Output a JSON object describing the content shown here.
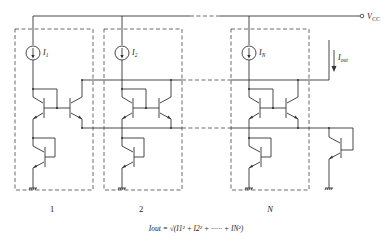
{
  "diagram": {
    "type": "circuit-schematic",
    "supply_label": "V",
    "supply_subscript": "CC",
    "output_current_label": "I",
    "output_current_subscript": "out",
    "cells": [
      {
        "index_label": "1",
        "source_label": "I",
        "source_subscript": "1"
      },
      {
        "index_label": "2",
        "source_label": "I",
        "source_subscript": "2"
      },
      {
        "index_label": "N",
        "source_label": "I",
        "source_subscript": "N"
      }
    ],
    "formula": "Iout = √(I1² + I2² + ······ + IN²)"
  }
}
